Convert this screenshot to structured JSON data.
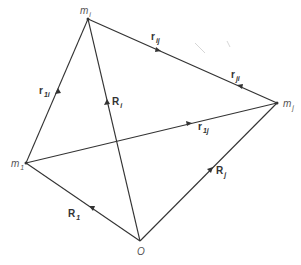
{
  "diagram": {
    "points": {
      "mi": {
        "label": "m",
        "sub": "i",
        "x": 88,
        "y": 19
      },
      "mj": {
        "label": "m",
        "sub": "j",
        "x": 277,
        "y": 103
      },
      "m1": {
        "label": "m",
        "sub": "1",
        "x": 26,
        "y": 163
      },
      "O": {
        "label": "O",
        "x": 140,
        "y": 241
      }
    },
    "vectors": [
      {
        "id": "rij",
        "label": "r",
        "sub": "ij",
        "from": "mi",
        "to": "mj",
        "arrow_at": 0.37
      },
      {
        "id": "rji",
        "label": "r",
        "sub": "ji",
        "from": "mj",
        "to": "mi",
        "arrow_at": 0.35
      },
      {
        "id": "r1i",
        "label": "r",
        "sub": "1i",
        "from": "m1",
        "to": "mi",
        "arrow_at": 0.45
      },
      {
        "id": "r1j",
        "label": "r",
        "sub": "1j",
        "from": "m1",
        "to": "mj",
        "arrow_at": 0.66
      },
      {
        "id": "Ri",
        "label": "R",
        "sub": "i",
        "from": "O",
        "to": "mi",
        "arrow_at": 0.6
      },
      {
        "id": "Rj",
        "label": "R",
        "sub": "j",
        "from": "O",
        "to": "mj",
        "arrow_at": 0.6
      },
      {
        "id": "R1",
        "label": "R",
        "sub": "1",
        "from": "O",
        "to": "m1",
        "arrow_at": 0.4
      }
    ],
    "labels": {
      "mi": {
        "text": "m",
        "sub": "i"
      },
      "mj": {
        "text": "m",
        "sub": "j"
      },
      "m1": {
        "text": "m",
        "sub": "1"
      },
      "O": {
        "text": "O"
      },
      "rij": {
        "text": "r",
        "sub": "ij"
      },
      "rji": {
        "text": "r",
        "sub": "ji"
      },
      "r1i": {
        "text": "r",
        "sub": "1i"
      },
      "r1j": {
        "text": "r",
        "sub": "1j"
      },
      "Ri": {
        "text": "R",
        "sub": "i"
      },
      "Rj": {
        "text": "R",
        "sub": "j"
      },
      "R1": {
        "text": "R",
        "sub": "1"
      }
    },
    "colors": {
      "line": "#333333",
      "text": "#333333",
      "background": "#ffffff"
    }
  }
}
